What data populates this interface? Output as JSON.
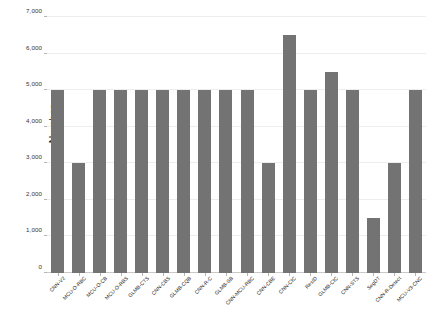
{
  "chart_data": {
    "type": "bar",
    "title": "",
    "xlabel": "",
    "ylabel": "Number",
    "ylim": [
      0,
      7000
    ],
    "ytick_values": [
      0,
      1000,
      2000,
      3000,
      4000,
      5000,
      6000,
      7000
    ],
    "ytick_labels": [
      "0",
      "1,000",
      "2,000",
      "3,000",
      "4,000",
      "5,000",
      "6,000",
      "7,000"
    ],
    "grid": true,
    "legend": false,
    "bar_color": "#737373",
    "categories": [
      "CNN-V2",
      "MCU-O-RBC",
      "MCU-O-CB",
      "MCU-O-RBS",
      "GLMB-CTS",
      "CNN-CBS",
      "GLMB-CQB",
      "CNN-R-C",
      "GLMB-SB",
      "CNN-MCU-RBC",
      "CNN-CBE",
      "CNN-CIC",
      "RestD",
      "GLMB-CIC",
      "CNN-STS",
      "SegDT",
      "CNN-R-Detect",
      "MCU-V3-CNC"
    ],
    "values": [
      5000,
      3000,
      5000,
      5000,
      5000,
      5000,
      5000,
      5000,
      5000,
      5000,
      3000,
      6500,
      5000,
      5500,
      5000,
      1500,
      3000,
      5000
    ]
  }
}
